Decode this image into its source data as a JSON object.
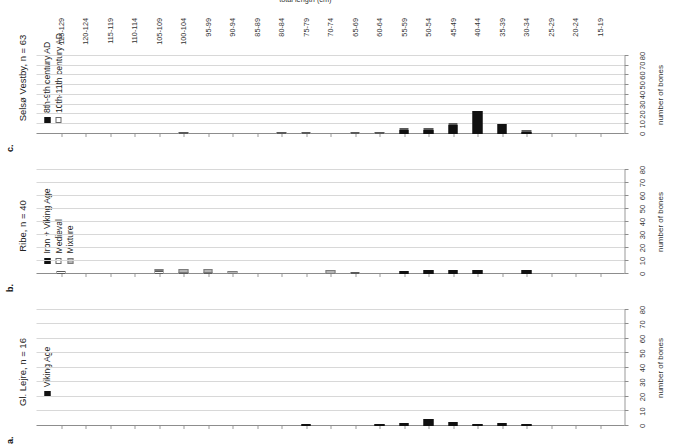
{
  "figure": {
    "x_axis_title": "number of bones",
    "category_axis_title": "total length (cm)",
    "categories": [
      "15-19",
      "20-24",
      "25-29",
      "30-34",
      "35-39",
      "40-44",
      "45-49",
      "50-54",
      "55-59",
      "60-64",
      "65-69",
      "70-74",
      "75-79",
      "80-84",
      "85-89",
      "90-94",
      "95-99",
      "100-104",
      "105-109",
      "110-114",
      "115-119",
      "120-124",
      "125-129"
    ],
    "x_ticks": [
      "0",
      "10",
      "20",
      "30",
      "40",
      "50",
      "60",
      "70",
      "80"
    ],
    "x_min": 0,
    "x_max": 80,
    "colors": {
      "black": "#111111",
      "white": "#ffffff",
      "gray": "#b4b4b4",
      "gridline": "#d8d8d8",
      "axis": "#8d8d8d"
    }
  },
  "panels": [
    {
      "letter": "a.",
      "title": "Gl. Lejre, n = 16",
      "legend": [
        {
          "label": "Viking Age",
          "style": "black"
        }
      ]
    },
    {
      "letter": "b.",
      "title": "Ribe, n = 40",
      "legend": [
        {
          "label": "Iron + Viking Age",
          "style": "black"
        },
        {
          "label": "Medieval",
          "style": "white"
        },
        {
          "label": "Mixture",
          "style": "gray"
        }
      ]
    },
    {
      "letter": "c.",
      "title": "Selsø Vestby, n = 63",
      "legend": [
        {
          "label": "8th-9th century AD",
          "style": "black"
        },
        {
          "label": "10th-11th century AD",
          "style": "white"
        }
      ]
    }
  ],
  "chart_data": [
    {
      "type": "bar",
      "title": "Gl. Lejre, n = 16",
      "orientation": "horizontal",
      "xlabel": "number of bones",
      "ylabel": "total length (cm)",
      "xlim": [
        0,
        80
      ],
      "grid": true,
      "legend_position": "top-center",
      "categories": [
        "15-19",
        "20-24",
        "25-29",
        "30-34",
        "35-39",
        "40-44",
        "45-49",
        "50-54",
        "55-59",
        "60-64",
        "65-69",
        "70-74",
        "75-79",
        "80-84",
        "85-89",
        "90-94",
        "95-99",
        "100-104",
        "105-109",
        "110-114",
        "115-119",
        "120-124",
        "125-129"
      ],
      "series": [
        {
          "name": "Viking Age",
          "style": "black",
          "values": [
            0,
            0,
            0,
            1,
            2,
            1,
            3,
            5,
            2,
            1,
            0,
            0,
            1,
            0,
            0,
            0,
            0,
            0,
            0,
            0,
            0,
            0,
            0
          ]
        }
      ]
    },
    {
      "type": "bar",
      "title": "Ribe, n = 40",
      "orientation": "horizontal",
      "xlabel": "number of bones",
      "ylabel": "total length (cm)",
      "xlim": [
        0,
        80
      ],
      "grid": true,
      "legend_position": "top-center",
      "categories": [
        "15-19",
        "20-24",
        "25-29",
        "30-34",
        "35-39",
        "40-44",
        "45-49",
        "50-54",
        "55-59",
        "60-64",
        "65-69",
        "70-74",
        "75-79",
        "80-84",
        "85-89",
        "90-94",
        "95-99",
        "100-104",
        "105-109",
        "110-114",
        "115-119",
        "120-124",
        "125-129"
      ],
      "series": [
        {
          "name": "Iron + Viking Age",
          "style": "black",
          "values": [
            0,
            0,
            0,
            3,
            0,
            3,
            3,
            3,
            2,
            0,
            0,
            0,
            0,
            0,
            0,
            0,
            0,
            0,
            0,
            0,
            0,
            0,
            0
          ]
        },
        {
          "name": "Medieval",
          "style": "white",
          "values": [
            0,
            0,
            0,
            0,
            0,
            0,
            0,
            0,
            0,
            0,
            1,
            0,
            0,
            0,
            0,
            0,
            1,
            1,
            2,
            0,
            0,
            0,
            2
          ]
        },
        {
          "name": "Mixture",
          "style": "gray",
          "values": [
            0,
            0,
            0,
            0,
            0,
            0,
            0,
            0,
            0,
            0,
            0,
            3,
            0,
            0,
            0,
            2,
            3,
            3,
            2,
            0,
            0,
            0,
            0
          ]
        }
      ]
    },
    {
      "type": "bar",
      "title": "Selsø Vestby, n = 63",
      "orientation": "horizontal",
      "xlabel": "number of bones",
      "ylabel": "total length (cm)",
      "xlim": [
        0,
        80
      ],
      "grid": true,
      "legend_position": "top-center",
      "categories": [
        "15-19",
        "20-24",
        "25-29",
        "30-34",
        "35-39",
        "40-44",
        "45-49",
        "50-54",
        "55-59",
        "60-64",
        "65-69",
        "70-74",
        "75-79",
        "80-84",
        "85-89",
        "90-94",
        "95-99",
        "100-104",
        "105-109",
        "110-114",
        "115-119",
        "120-124",
        "125-129"
      ],
      "series": [
        {
          "name": "8th-9th century AD",
          "style": "black",
          "values": [
            0,
            0,
            0,
            2,
            10,
            24,
            9,
            4,
            4,
            0,
            0,
            0,
            0,
            0,
            0,
            0,
            0,
            0,
            0,
            0,
            0,
            0,
            0
          ]
        },
        {
          "name": "10th-11th century AD",
          "style": "white",
          "values": [
            0,
            0,
            0,
            1,
            0,
            0,
            1,
            2,
            2,
            1,
            1,
            0,
            1,
            2,
            0,
            0,
            0,
            1,
            0,
            0,
            0,
            0,
            0
          ]
        }
      ]
    }
  ]
}
